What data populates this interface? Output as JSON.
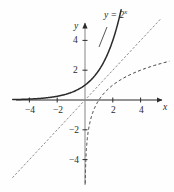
{
  "figure": {
    "background_color": "#fefefe",
    "ink_color": "#2b2b2b"
  },
  "labels": {
    "x_axis_name": "x",
    "y_axis_name": "y",
    "curve_label_base": "y = 2",
    "curve_label_exponent": "x"
  },
  "ticks": {
    "x": [
      {
        "value": -4,
        "text": "−4"
      },
      {
        "value": -2,
        "text": "−2"
      },
      {
        "value": 2,
        "text": "2"
      },
      {
        "value": 4,
        "text": "4"
      }
    ],
    "y": [
      {
        "value": 4,
        "text": "4"
      },
      {
        "value": 2,
        "text": "2"
      },
      {
        "value": -2,
        "text": "−2"
      },
      {
        "value": -4,
        "text": "−4"
      }
    ]
  },
  "chart_data": {
    "type": "line",
    "title": "",
    "xlabel": "x",
    "ylabel": "y",
    "xlim": [
      -5.2,
      5.8
    ],
    "ylim": [
      -5.6,
      5.8
    ],
    "grid": false,
    "legend": "inline-annotation",
    "annotations": [
      {
        "text": "y = 2^x",
        "x": 1.5,
        "y": 5.6,
        "target_curve": "exponential"
      }
    ],
    "series": [
      {
        "name": "y = 2^x",
        "style": "solid",
        "color": "#2b2b2b",
        "width": 1.5,
        "x": [
          -5,
          -4.5,
          -4,
          -3.5,
          -3,
          -2.5,
          -2,
          -1.5,
          -1,
          -0.5,
          0,
          0.5,
          1,
          1.5,
          2,
          2.25,
          2.5
        ],
        "y": [
          0.031,
          0.044,
          0.063,
          0.088,
          0.125,
          0.177,
          0.25,
          0.354,
          0.5,
          0.707,
          1,
          1.414,
          2,
          2.828,
          4,
          4.757,
          5.657
        ]
      },
      {
        "name": "y = x",
        "style": "dotted",
        "color": "#8c8c8c",
        "width": 1,
        "x": [
          -5.2,
          5.4
        ],
        "y": [
          -5.2,
          5.4
        ]
      },
      {
        "name": "y = log2 x",
        "style": "dashed",
        "color": "#3a3a3a",
        "width": 1,
        "x": [
          0.031,
          0.044,
          0.063,
          0.088,
          0.125,
          0.177,
          0.25,
          0.354,
          0.5,
          0.707,
          1,
          1.414,
          2,
          2.828,
          4,
          4.757,
          5.657
        ],
        "y": [
          -5,
          -4.5,
          -4,
          -3.5,
          -3,
          -2.5,
          -2,
          -1.5,
          -1,
          -0.5,
          0,
          0.5,
          1,
          1.5,
          2,
          2.25,
          2.5
        ]
      }
    ]
  }
}
